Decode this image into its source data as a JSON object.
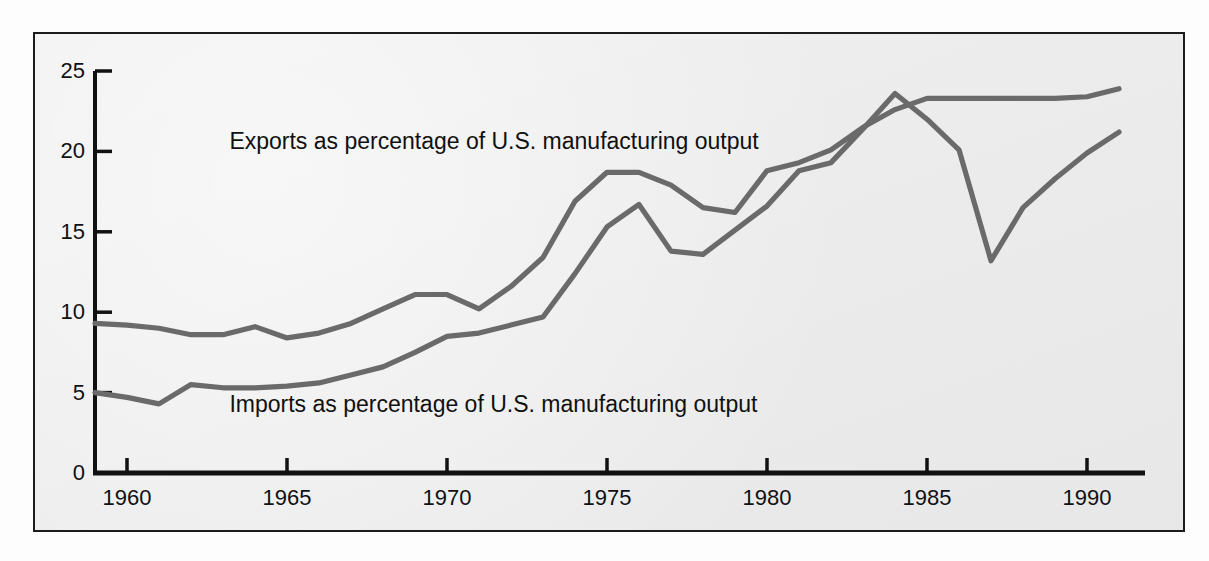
{
  "figure": {
    "background_color": "#ececec",
    "border_color": "#1c1c1c",
    "axis_color": "#111111",
    "line_color": "#6a6a6a"
  },
  "chart_data": {
    "type": "line",
    "title": "",
    "subtitle": "",
    "xlabel": "",
    "ylabel": "",
    "xlim": [
      1959,
      1991
    ],
    "ylim": [
      0,
      25
    ],
    "grid": false,
    "legend_position": "inline-annotation",
    "x_ticks": [
      "1960",
      "1965",
      "1970",
      "1975",
      "1980",
      "1985",
      "1990"
    ],
    "x_tick_values": [
      1960,
      1965,
      1970,
      1975,
      1980,
      1985,
      1990
    ],
    "y_ticks": [
      "0",
      "5",
      "10",
      "15",
      "20",
      "25"
    ],
    "y_tick_values": [
      0,
      5,
      10,
      15,
      20,
      25
    ],
    "annotations": [
      {
        "text": "Exports as percentage of U.S. manufacturing output",
        "x": 1963.2,
        "y": 20.6
      },
      {
        "text": "Imports as percentage of U.S. manufacturing output",
        "x": 1963.2,
        "y": 4.2
      }
    ],
    "x": [
      1959,
      1960,
      1961,
      1962,
      1963,
      1964,
      1965,
      1966,
      1967,
      1968,
      1969,
      1970,
      1971,
      1972,
      1973,
      1974,
      1975,
      1976,
      1977,
      1978,
      1979,
      1980,
      1981,
      1982,
      1983,
      1984,
      1985,
      1986,
      1987,
      1988,
      1989,
      1990,
      1991
    ],
    "series": [
      {
        "name": "Imports as percentage of U.S. manufacturing output",
        "color": "#6a6a6a",
        "values": [
          9.3,
          9.2,
          9.0,
          8.6,
          8.6,
          9.1,
          8.4,
          8.7,
          9.3,
          10.2,
          11.1,
          11.1,
          10.2,
          11.6,
          13.4,
          16.9,
          18.7,
          18.7,
          17.9,
          16.5,
          16.2,
          18.8,
          19.3,
          20.1,
          21.5,
          22.6,
          23.3,
          23.3,
          23.3,
          23.3,
          23.3,
          23.4,
          23.9
        ]
      },
      {
        "name": "Exports as percentage of U.S. manufacturing output",
        "color": "#6a6a6a",
        "values": [
          5.0,
          4.7,
          4.3,
          5.5,
          5.3,
          5.3,
          5.4,
          5.6,
          6.1,
          6.6,
          7.5,
          8.5,
          8.7,
          9.2,
          9.7,
          12.4,
          15.3,
          16.7,
          13.8,
          13.6,
          15.1,
          16.6,
          18.8,
          19.3,
          21.4,
          23.6,
          22.0,
          20.1,
          13.2,
          16.5,
          18.3,
          19.9,
          21.2
        ]
      }
    ]
  }
}
